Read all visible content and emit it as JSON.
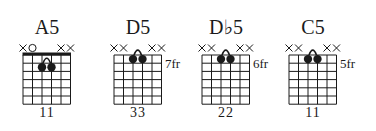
{
  "chords": [
    {
      "name": "A5",
      "fret_label": "",
      "fingering": "11",
      "nut": true,
      "string_markers": [
        "x",
        "o",
        "",
        "",
        "x",
        "x"
      ],
      "dots": [
        {
          "string": 3,
          "fret": 2
        },
        {
          "string": 4,
          "fret": 2
        }
      ],
      "barre_arc": {
        "from": 3,
        "to": 4,
        "fret": 2
      }
    },
    {
      "name": "D5",
      "fret_label": "7fr",
      "fingering": "33",
      "nut": false,
      "string_markers": [
        "x",
        "x",
        "",
        "",
        "x",
        "x"
      ],
      "dots": [
        {
          "string": 3,
          "fret": 1
        },
        {
          "string": 4,
          "fret": 1
        }
      ],
      "barre_arc": {
        "from": 3,
        "to": 4,
        "fret": 1
      }
    },
    {
      "name": "D♭5",
      "fret_label": "6fr",
      "fingering": "22",
      "nut": false,
      "string_markers": [
        "x",
        "x",
        "",
        "",
        "x",
        "x"
      ],
      "dots": [
        {
          "string": 3,
          "fret": 1
        },
        {
          "string": 4,
          "fret": 1
        }
      ],
      "barre_arc": {
        "from": 3,
        "to": 4,
        "fret": 1
      }
    },
    {
      "name": "C5",
      "fret_label": "5fr",
      "fingering": "11",
      "nut": false,
      "string_markers": [
        "x",
        "x",
        "",
        "",
        "x",
        "x"
      ],
      "dots": [
        {
          "string": 3,
          "fret": 1
        },
        {
          "string": 4,
          "fret": 1
        }
      ],
      "barre_arc": {
        "from": 3,
        "to": 4,
        "fret": 1
      }
    }
  ],
  "grid": {
    "strings": 6,
    "frets": 6
  },
  "colors": {
    "ink": "#1a1a1a",
    "background": "#ffffff"
  }
}
